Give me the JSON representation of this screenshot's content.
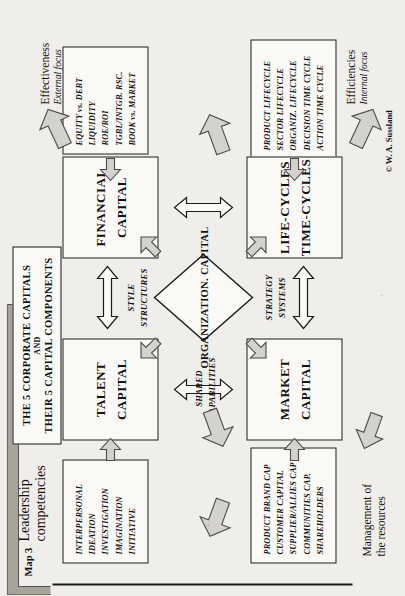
{
  "figure": {
    "map_number": "Map 3",
    "subtitle_line1": "Leadership",
    "subtitle_line2": "competencies",
    "copyright": "© W. A. Sussland"
  },
  "title_box": {
    "line1": "THE 5 CORPORATE CAPITALS",
    "line2": "AND",
    "line3": "THEIR 5 CAPITAL COMPONENTS"
  },
  "capitals": [
    {
      "id": "talent",
      "line1": "TALENT",
      "line2": "CAPITAL"
    },
    {
      "id": "market",
      "line1": "MARKET",
      "line2": "CAPITAL"
    },
    {
      "id": "financial",
      "line1": "FINANCIAL",
      "line2": "CAPITAL"
    },
    {
      "id": "lifecycle",
      "line1": "LIFE-CYCLES",
      "line2": "TIME-CYCLES"
    }
  ],
  "center": {
    "line1": "ORGANIZATION.",
    "line2": "CAPITAL"
  },
  "components": {
    "talent": [
      "INTERPERSONAL",
      "IDEATION",
      "INVESTIGATION",
      "IMAGINATION",
      "INITIATIVE"
    ],
    "market": [
      "PRODUCT  BRAND CAP",
      "CUSTOMER CAPITAL",
      "SUPPLIER/ALLIES CAP",
      "COMMUNITIES CAP.",
      "SHAREHOLDERS"
    ],
    "financial": [
      "EQUITY vs. DEBT",
      "LIQUIDITY",
      "ROE/ROI",
      "TGBL/INTGB. RSC.",
      "BOOK vs. MARKET"
    ],
    "lifecycle": [
      "PRODUCT LIFECYCLE",
      "SECTOR LIFECYCLE",
      "ORGANIZ. LIFECYCLE",
      "DECISION TIME CYCLE",
      "ACTION  TIME CYCLE"
    ]
  },
  "axis_labels": {
    "shared": {
      "line1": "SHARED",
      "line2": "CAPABILITIES"
    },
    "style": {
      "line1": "STYLE",
      "line2": "STRUCTURES"
    },
    "strategy": {
      "line1": "STRATEGY",
      "line2": "SYSTEMS"
    }
  },
  "focus": {
    "effectiveness": {
      "title": "Effectiveness",
      "sub": "External focus"
    },
    "efficiencies": {
      "title": "Efficiencies",
      "sub": "Internal focus"
    }
  },
  "management": {
    "line1": "Management of",
    "line2": "the resources"
  },
  "colors": {
    "page_background": "#efede8",
    "box_fill": "#faf9f6",
    "ink": "#111111",
    "arrow_fill": "#d4d2cd",
    "arrow_stroke": "#4a4a48"
  }
}
